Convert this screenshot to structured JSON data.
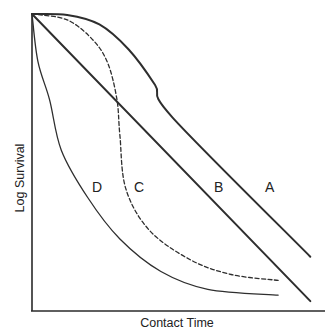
{
  "chart_data": {
    "type": "line",
    "title": "",
    "xlabel": "Contact Time",
    "ylabel": "Log Survival",
    "grid": false,
    "legend": "none (curves labeled inline)",
    "x_ticks": [],
    "y_ticks": [],
    "note": "Schematic survival curves; no numeric axes. Coordinates below are normalized: x = contact time fraction (0..1), y = log survival fraction from top (0 = initial, 1 = axis bottom).",
    "series": [
      {
        "name": "A",
        "style": "solid",
        "width": 2.0,
        "shape": "shoulder then linear decline",
        "points": [
          [
            0,
            0
          ],
          [
            0.12,
            0.003
          ],
          [
            0.23,
            0.035
          ],
          [
            0.33,
            0.12
          ],
          [
            0.42,
            0.24
          ],
          [
            0.48,
            0.35
          ],
          [
            0.95,
            0.82
          ]
        ],
        "label_pos": [
          0.81,
          0.58
        ]
      },
      {
        "name": "B",
        "style": "solid",
        "width": 2.0,
        "shape": "linear (first-order) decline",
        "points": [
          [
            0,
            0
          ],
          [
            0.95,
            0.97
          ]
        ],
        "label_pos": [
          0.64,
          0.58
        ]
      },
      {
        "name": "C",
        "style": "dashed",
        "width": 1.3,
        "shape": "shoulder, sharp drop, then tailing",
        "points": [
          [
            0,
            0
          ],
          [
            0.12,
            0.02
          ],
          [
            0.21,
            0.09
          ],
          [
            0.26,
            0.17
          ],
          [
            0.29,
            0.29
          ],
          [
            0.3,
            0.41
          ],
          [
            0.32,
            0.59
          ],
          [
            0.4,
            0.73
          ],
          [
            0.54,
            0.83
          ],
          [
            0.68,
            0.88
          ],
          [
            0.84,
            0.9
          ]
        ],
        "label_pos": [
          0.37,
          0.58
        ]
      },
      {
        "name": "D",
        "style": "solid",
        "width": 1.3,
        "shape": "concave (rapid initial kill) with tailing",
        "points": [
          [
            0,
            0
          ],
          [
            0.02,
            0.16
          ],
          [
            0.06,
            0.29
          ],
          [
            0.1,
            0.46
          ],
          [
            0.19,
            0.62
          ],
          [
            0.3,
            0.76
          ],
          [
            0.44,
            0.87
          ],
          [
            0.6,
            0.93
          ],
          [
            0.84,
            0.95
          ]
        ],
        "label_pos": [
          0.22,
          0.58
        ]
      }
    ]
  },
  "plot": {
    "origin": [
      32,
      310
    ],
    "top": 14,
    "right": 325,
    "width": 293,
    "height": 296
  },
  "labels": {
    "x_axis": "Contact Time",
    "y_axis": "Log Survival",
    "curve_a": "A",
    "curve_b": "B",
    "curve_c": "C",
    "curve_d": "D"
  }
}
